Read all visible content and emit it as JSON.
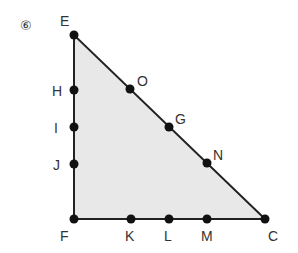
{
  "problem_number": "⑥",
  "colors": {
    "fill": "#e8e8e8",
    "stroke": "#222222",
    "point": "#111111",
    "text": "#333333"
  },
  "triangle": {
    "vertices": [
      "E",
      "F",
      "C"
    ]
  },
  "points": [
    {
      "id": "E",
      "x": 74,
      "y": 35,
      "lx": 60,
      "ly": 26
    },
    {
      "id": "H",
      "x": 74,
      "y": 90,
      "lx": 52,
      "ly": 96
    },
    {
      "id": "I",
      "x": 74,
      "y": 127,
      "lx": 54,
      "ly": 133
    },
    {
      "id": "J",
      "x": 74,
      "y": 164,
      "lx": 53,
      "ly": 170
    },
    {
      "id": "F",
      "x": 74,
      "y": 219,
      "lx": 60,
      "ly": 241
    },
    {
      "id": "O",
      "x": 130,
      "y": 89,
      "lx": 137,
      "ly": 86
    },
    {
      "id": "G",
      "x": 169,
      "y": 127,
      "lx": 175,
      "ly": 124
    },
    {
      "id": "N",
      "x": 207,
      "y": 163,
      "lx": 213,
      "ly": 160
    },
    {
      "id": "C",
      "x": 265,
      "y": 219,
      "lx": 268,
      "ly": 241
    },
    {
      "id": "K",
      "x": 131,
      "y": 219,
      "lx": 125,
      "ly": 241
    },
    {
      "id": "L",
      "x": 169,
      "y": 219,
      "lx": 164,
      "ly": 241
    },
    {
      "id": "M",
      "x": 207,
      "y": 219,
      "lx": 201,
      "ly": 241
    }
  ]
}
